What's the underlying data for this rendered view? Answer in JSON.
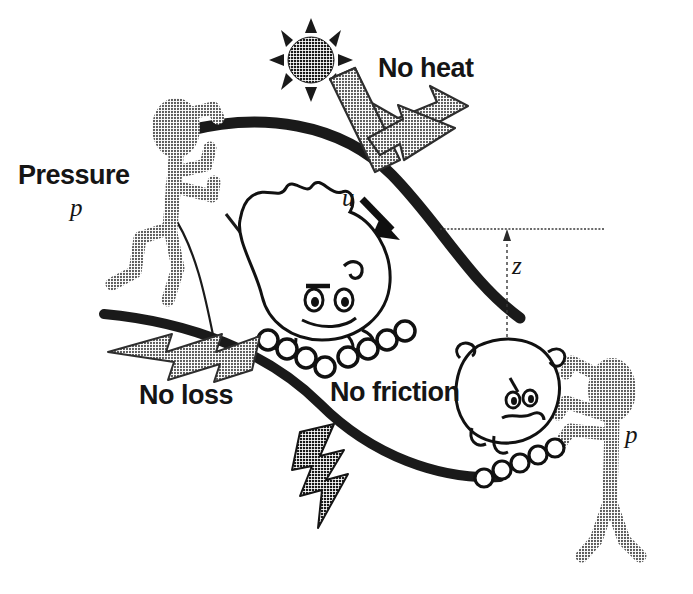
{
  "figure": {
    "background_color": "#ffffff",
    "width": 693,
    "height": 594
  },
  "colors": {
    "ink": "#151515",
    "pipe_wall": "#1a1a1a",
    "figure_gray": "#7e7e7e",
    "arrow_gray": "#6e6e6e",
    "bolt_dark": "#2b2b2b",
    "sun": "#1f1f1f",
    "datum": "#444444"
  },
  "labels": {
    "pressure": "Pressure",
    "p_left": "p",
    "no_heat": "No heat",
    "velocity_u": "u",
    "height_z": "z",
    "no_loss": "No loss",
    "no_friction": "No friction",
    "p_right": "p"
  },
  "icons": {
    "sun": "sun-icon",
    "heat_arrow": "heat-out-arrow-icon",
    "velocity_arrow": "velocity-arrow-icon",
    "loss_arrow_left": "loss-bolt-arrow-left-icon",
    "loss_bolt_down": "loss-bolt-down-icon",
    "friction_skate_left": "roller-skate-icon",
    "friction_skate_right": "roller-skate-icon",
    "datum_line": "datum-line-icon",
    "z_dimension": "z-dimension-arrow-icon"
  },
  "actors": {
    "left_figure": "pressure-pusher-left",
    "right_figure": "pressure-pusher-right",
    "happy_blob": "happy-fluid-particle",
    "sad_blob": "sad-fluid-particle"
  },
  "annotations": [
    {
      "name": "pressure-label",
      "text": "Pressure"
    },
    {
      "name": "pressure-symbol",
      "text": "p"
    },
    {
      "name": "no-heat-label",
      "text": "No heat"
    },
    {
      "name": "velocity-symbol",
      "text": "u"
    },
    {
      "name": "elevation-symbol",
      "text": "z"
    },
    {
      "name": "no-loss-label",
      "text": "No loss"
    },
    {
      "name": "no-friction-label",
      "text": "No friction"
    },
    {
      "name": "pressure-symbol-right",
      "text": "p"
    }
  ]
}
